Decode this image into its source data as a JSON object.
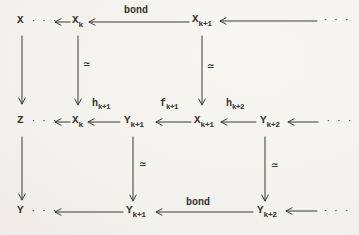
{
  "figure": {
    "type": "commutative-diagram",
    "background_color": "#f3f1ec",
    "ink_color": "#36332c"
  },
  "nodes": {
    "x_top": {
      "base": "X"
    },
    "z_mid": {
      "base": "Z"
    },
    "y_bot": {
      "base": "Y"
    },
    "xk_top": {
      "base": "X",
      "sub": "k"
    },
    "xk1_top": {
      "base": "X",
      "sub": "k+1"
    },
    "xk_mid": {
      "base": "X",
      "sub": "k"
    },
    "yk1_mid": {
      "base": "Y",
      "sub": "k+1"
    },
    "xk1_mid": {
      "base": "X",
      "sub": "k+1"
    },
    "yk2_mid": {
      "base": "Y",
      "sub": "k+2"
    },
    "yk1_bot": {
      "base": "Y",
      "sub": "k+1"
    },
    "yk2_bot": {
      "base": "Y",
      "sub": "k+2"
    }
  },
  "arrow_labels": {
    "bond_top": "bond",
    "bond_bottom": "bond",
    "h_k1": {
      "base": "h",
      "sub": "k+1"
    },
    "f_k1": {
      "base": "f",
      "sub": "k+1"
    },
    "h_k2": {
      "base": "h",
      "sub": "k+2"
    },
    "simeq": "≃"
  },
  "ellipsis": "· · ·"
}
